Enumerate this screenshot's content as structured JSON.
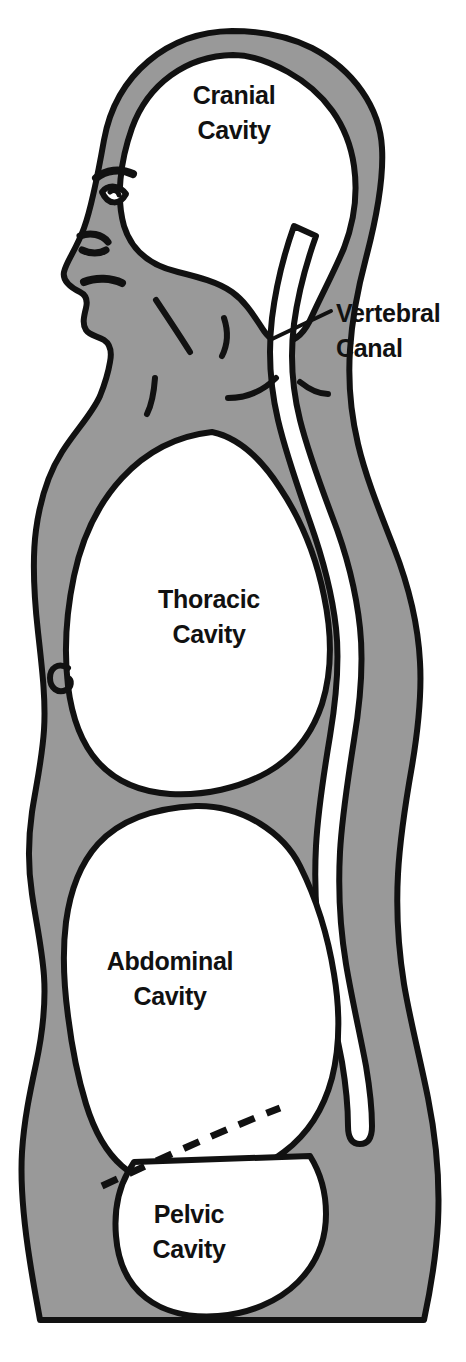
{
  "figure": {
    "view": "lateral sagittal silhouette of human body, facing left",
    "background_color": "#ffffff",
    "tissue_fill_color": "#999999",
    "cavity_fill_color": "#ffffff",
    "outline_color": "#111111",
    "text_color": "#111111"
  },
  "labels": {
    "cranial": {
      "line1": "Cranial",
      "line2": "Cavity",
      "x": 234,
      "y": 104
    },
    "thoracic": {
      "line1": "Thoracic",
      "line2": "Cavity",
      "x": 209,
      "y": 608
    },
    "abdominal": {
      "line1": "Abdominal",
      "line2": "Cavity",
      "x": 170,
      "y": 970
    },
    "pelvic": {
      "line1": "Pelvic",
      "line2": "Cavity",
      "x": 189,
      "y": 1223
    },
    "vertebral": {
      "line1": "Vertebral",
      "line2": "Canal",
      "x": 336,
      "y": 322
    }
  },
  "callout": {
    "name": "vertebral-canal-leader",
    "from_x": 270,
    "from_y": 340,
    "to_x": 331,
    "to_y": 311
  },
  "cavities": [
    {
      "id": "cranial",
      "name": "Cranial Cavity",
      "region": "head",
      "filled": "white"
    },
    {
      "id": "vertebral",
      "name": "Vertebral Canal",
      "region": "spine",
      "filled": "white"
    },
    {
      "id": "thoracic",
      "name": "Thoracic Cavity",
      "region": "chest",
      "filled": "white"
    },
    {
      "id": "abdominal",
      "name": "Abdominal Cavity",
      "region": "belly",
      "filled": "white"
    },
    {
      "id": "pelvic",
      "name": "Pelvic Cavity",
      "region": "pelvis",
      "filled": "white"
    }
  ],
  "dividers": [
    {
      "id": "diaphragm",
      "name": "diaphragm",
      "style": "solid",
      "between": [
        "thoracic",
        "abdominal"
      ]
    },
    {
      "id": "pelvic-brim",
      "name": "abdominopelvic boundary",
      "style": "dashed",
      "between": [
        "abdominal",
        "pelvic"
      ]
    }
  ],
  "face_features": [
    "eyebrow",
    "eye",
    "nose",
    "lips",
    "chin",
    "jawline",
    "ear-line"
  ]
}
